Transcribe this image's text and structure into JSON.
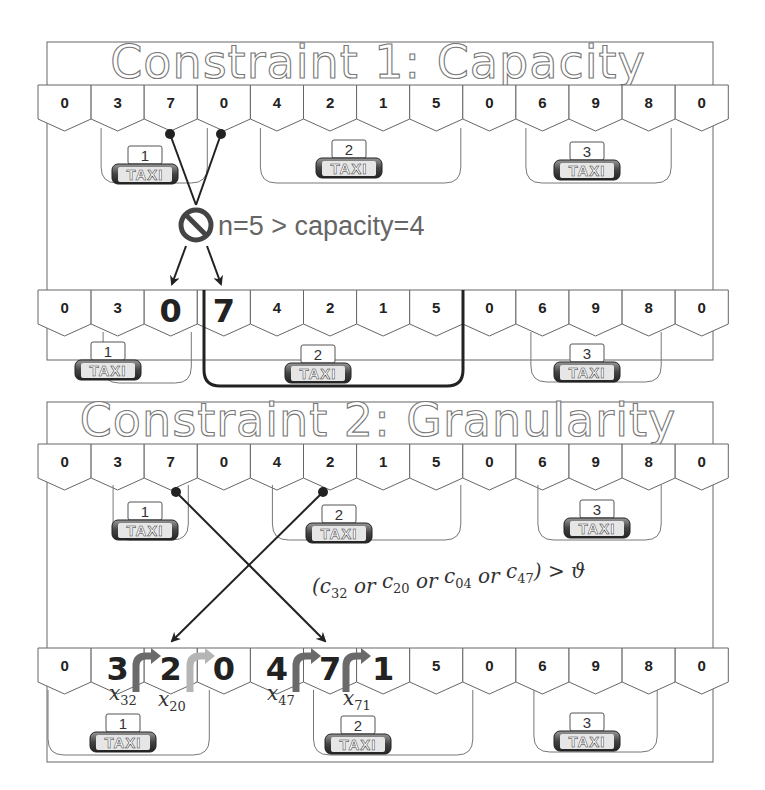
{
  "panel1": {
    "title": "Constraint 1: Capacity",
    "row_before": [
      "0",
      "3",
      "7",
      "0",
      "4",
      "2",
      "1",
      "5",
      "0",
      "6",
      "9",
      "8",
      "0"
    ],
    "row_after": [
      "0",
      "3",
      "0",
      "7",
      "4",
      "2",
      "1",
      "5",
      "0",
      "6",
      "9",
      "8",
      "0"
    ],
    "taxis_before": [
      {
        "num": "1",
        "label": "TAXI"
      },
      {
        "num": "2",
        "label": "TAXI"
      },
      {
        "num": "3",
        "label": "TAXI"
      }
    ],
    "taxis_after": [
      {
        "num": "1",
        "label": "TAXI"
      },
      {
        "num": "2",
        "label": "TAXI"
      },
      {
        "num": "3",
        "label": "TAXI"
      }
    ],
    "violation_note": "n=5 > capacity=4"
  },
  "panel2": {
    "title": "Constraint 2: Granularity",
    "row_before": [
      "0",
      "3",
      "7",
      "0",
      "4",
      "2",
      "1",
      "5",
      "0",
      "6",
      "9",
      "8",
      "0"
    ],
    "row_after": [
      "0",
      "3",
      "2",
      "0",
      "4",
      "7",
      "1",
      "5",
      "0",
      "6",
      "9",
      "8",
      "0"
    ],
    "taxis_before": [
      {
        "num": "1",
        "label": "TAXI"
      },
      {
        "num": "2",
        "label": "TAXI"
      },
      {
        "num": "3",
        "label": "TAXI"
      }
    ],
    "taxis_after": [
      {
        "num": "1",
        "label": "TAXI"
      },
      {
        "num": "2",
        "label": "TAXI"
      },
      {
        "num": "3",
        "label": "TAXI"
      }
    ],
    "condition": {
      "open": "(",
      "terms": [
        {
          "var": "c",
          "sub": "32"
        },
        {
          "var": "c",
          "sub": "20"
        },
        {
          "var": "c",
          "sub": "04"
        },
        {
          "var": "c",
          "sub": "47"
        }
      ],
      "joiner": "or",
      "close": ") > ϑ"
    },
    "transition_labels": [
      {
        "var": "x",
        "sub": "32"
      },
      {
        "var": "x",
        "sub": "20"
      },
      {
        "var": "x",
        "sub": "47"
      },
      {
        "var": "x",
        "sub": "71"
      }
    ]
  },
  "colors": {
    "line": "#222222",
    "outline": "#777777",
    "arrow_dark": "#6a6a6a",
    "arrow_light": "#b5b5b5"
  }
}
